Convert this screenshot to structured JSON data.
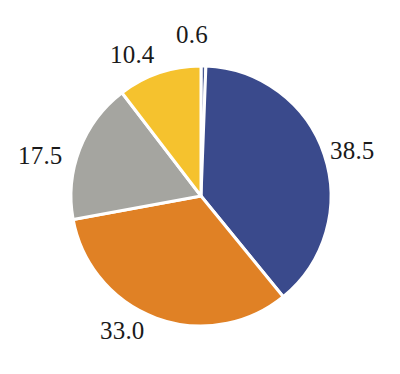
{
  "chart_data": {
    "type": "pie",
    "title": "",
    "subtitle": "",
    "xlabel": "",
    "ylabel": "",
    "legend": "none",
    "grid": false,
    "start_angle_deg": 0,
    "direction": "clockwise",
    "total": 100.0,
    "categories": [
      "0.6",
      "38.5",
      "33.0",
      "17.5",
      "10.4"
    ],
    "values": [
      0.6,
      38.5,
      33.0,
      17.5,
      10.4
    ],
    "labels": [
      "0.6",
      "38.5",
      "33.0",
      "17.5",
      "10.4"
    ],
    "colors": [
      "#4a5a93",
      "#3a4a8c",
      "#e08125",
      "#a5a5a0",
      "#f5c22e"
    ],
    "slices": [
      {
        "label": "0.6",
        "value": 0.6,
        "color": "#4a5a93"
      },
      {
        "label": "38.5",
        "value": 38.5,
        "color": "#3a4a8c"
      },
      {
        "label": "33.0",
        "value": 33.0,
        "color": "#e08125"
      },
      {
        "label": "17.5",
        "value": 17.5,
        "color": "#a5a5a0"
      },
      {
        "label": "10.4",
        "value": 10.4,
        "color": "#f5c22e"
      }
    ],
    "geometry": {
      "center_x": 201,
      "center_y": 196,
      "radius": 130,
      "gap_color": "#ffffff",
      "gap_width": 3
    },
    "background": "#ffffff"
  }
}
